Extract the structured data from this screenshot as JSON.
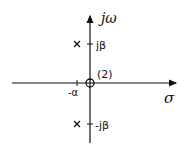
{
  "diagram": {
    "axes": {
      "vertical_label": "jω",
      "horizontal_label": "σ"
    },
    "ticks": {
      "upper": "jβ",
      "lower": "-jβ",
      "left": "-α"
    },
    "zero": {
      "multiplicity_label": "(2)",
      "location": "origin"
    },
    "poles": [
      {
        "label": "-α + jβ",
        "marker": "x"
      },
      {
        "label": "-α - jβ",
        "marker": "x"
      }
    ],
    "colors": {
      "stroke": "#111111",
      "background": "#ffffff"
    }
  }
}
